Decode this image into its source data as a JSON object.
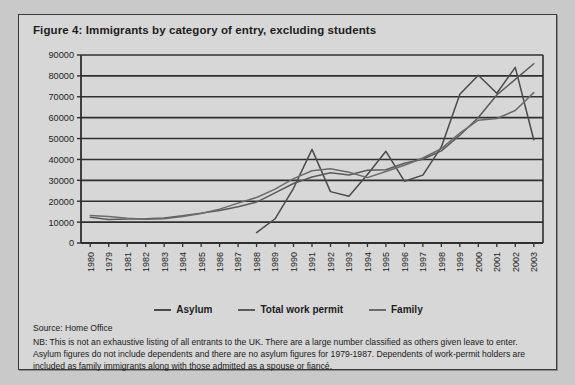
{
  "figure": {
    "title": "Figure 4: Immigrants by category of entry, excluding students",
    "source": "Source: Home Office",
    "note": "NB: This is not an exhaustive listing of all entrants to the UK. There are a large number classified as others given leave to enter. Asylum figures do not include dependents and there are no asylum figures for 1979-1987. Dependents of work-permit holders are included as family immigrants along with those admitted as a spouse or fiancé."
  },
  "colors": {
    "panel_background": "#d7d7d7",
    "page_background": "#c9c9c9",
    "border": "#3b3b3b",
    "gridline": "#2f2f2f",
    "asylum": "#4a4a4a",
    "total_work_permit": "#5a5a5a",
    "family": "#6b6b6b",
    "text": "#1d1d1d"
  },
  "legend": {
    "position": "below-axis",
    "items": [
      {
        "label": "Asylum",
        "color": "#4a4a4a"
      },
      {
        "label": "Total work permit",
        "color": "#5a5a5a"
      },
      {
        "label": "Family",
        "color": "#6b6b6b"
      }
    ]
  },
  "chart_data": {
    "type": "line",
    "title": "Figure 4: Immigrants by category of entry, excluding students",
    "xlabel": "",
    "ylabel": "",
    "ylim": [
      0,
      90000
    ],
    "ytick_step": 10000,
    "yticks": [
      0,
      10000,
      20000,
      30000,
      40000,
      50000,
      60000,
      70000,
      80000,
      90000
    ],
    "ytick_labels": [
      "0",
      "10000",
      "20000",
      "30000",
      "40000",
      "50000",
      "60000",
      "70000",
      "80000",
      "90000"
    ],
    "grid": "horizontal",
    "categories": [
      "1980",
      "1979",
      "1981",
      "1982",
      "1983",
      "1984",
      "1985",
      "1986",
      "1987",
      "1988",
      "1989",
      "1990",
      "1991",
      "1992",
      "1993",
      "1994",
      "1995",
      "1996",
      "1997",
      "1998",
      "1999",
      "2000",
      "2001",
      "2002",
      "2003"
    ],
    "series": [
      {
        "name": "Asylum",
        "color": "#4a4a4a",
        "values": [
          null,
          null,
          null,
          null,
          null,
          null,
          null,
          null,
          null,
          5000,
          11600,
          26200,
          44800,
          24600,
          22400,
          32800,
          43900,
          29600,
          32500,
          46000,
          71200,
          80300,
          71700,
          84100,
          49400
        ]
      },
      {
        "name": "Total work permit",
        "color": "#5a5a5a",
        "values": [
          12300,
          11300,
          11500,
          11600,
          12000,
          13000,
          14300,
          15600,
          17400,
          19600,
          24000,
          28500,
          31600,
          33600,
          32600,
          34800,
          35100,
          38200,
          40100,
          44100,
          51600,
          60100,
          70900,
          78300,
          85800
        ]
      },
      {
        "name": "Family",
        "color": "#6b6b6b",
        "values": [
          13200,
          12700,
          11900,
          11400,
          11600,
          12700,
          14100,
          16200,
          19100,
          21800,
          25800,
          30800,
          34600,
          35500,
          33900,
          31300,
          34200,
          37200,
          40700,
          45200,
          52600,
          58800,
          59600,
          63400,
          72000
        ]
      }
    ]
  }
}
